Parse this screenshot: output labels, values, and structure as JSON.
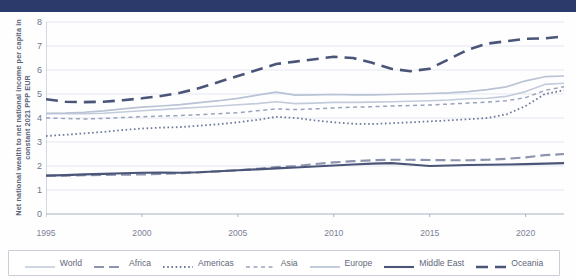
{
  "ylabel_text": "Net national wealth to net national income per capita in constant 2021 PPP EUR",
  "legend": {
    "items": [
      {
        "label": "World",
        "color": "#c3ccdc",
        "dash": "none",
        "width": 1.6
      },
      {
        "label": "Africa",
        "color": "#8d95ae",
        "dash": "10,5",
        "width": 2.2
      },
      {
        "label": "Americas",
        "color": "#6f7a99",
        "dash": "1.6,2.6",
        "width": 1.8
      },
      {
        "label": "Asia",
        "color": "#9aa3bb",
        "dash": "4,3.5",
        "width": 1.5
      },
      {
        "label": "Europe",
        "color": "#b9c3d5",
        "dash": "none",
        "width": 1.7
      },
      {
        "label": "Middle East",
        "color": "#4a5578",
        "dash": "none",
        "width": 2.1
      },
      {
        "label": "Oceania",
        "color": "#4a5578",
        "dash": "12,7",
        "width": 2.6
      }
    ]
  },
  "chart_data": {
    "type": "line",
    "title": "",
    "xlabel": "",
    "ylabel": "Net national wealth to net national income per capita in constant 2021 PPP EUR",
    "xlim": [
      1995,
      2022
    ],
    "ylim": [
      0,
      8
    ],
    "yticks": [
      0,
      1,
      2,
      3,
      4,
      5,
      6,
      7,
      8
    ],
    "xticks": [
      1995,
      2000,
      2005,
      2010,
      2015,
      2020
    ],
    "grid": "horizontal",
    "legend_position": "bottom",
    "x": [
      1995,
      1996,
      1997,
      1998,
      1999,
      2000,
      2001,
      2002,
      2003,
      2004,
      2005,
      2006,
      2007,
      2008,
      2009,
      2010,
      2011,
      2012,
      2013,
      2014,
      2015,
      2016,
      2017,
      2018,
      2019,
      2020,
      2021,
      2022
    ],
    "series": [
      {
        "name": "World",
        "color": "#c3ccdc",
        "dash": "none",
        "values": [
          4.2,
          4.18,
          4.18,
          4.2,
          4.25,
          4.3,
          4.35,
          4.4,
          4.45,
          4.5,
          4.55,
          4.6,
          4.68,
          4.6,
          4.62,
          4.65,
          4.65,
          4.66,
          4.68,
          4.7,
          4.72,
          4.75,
          4.8,
          4.82,
          4.9,
          5.1,
          5.4,
          5.45
        ]
      },
      {
        "name": "Africa",
        "color": "#8d95ae",
        "dash": "10,5",
        "values": [
          1.6,
          1.6,
          1.62,
          1.63,
          1.64,
          1.65,
          1.67,
          1.7,
          1.74,
          1.78,
          1.82,
          1.88,
          1.95,
          2.0,
          2.08,
          2.15,
          2.2,
          2.24,
          2.26,
          2.26,
          2.25,
          2.24,
          2.24,
          2.26,
          2.3,
          2.36,
          2.45,
          2.5
        ]
      },
      {
        "name": "Americas",
        "color": "#6f7a99",
        "dash": "1.6,2.6",
        "values": [
          3.25,
          3.3,
          3.36,
          3.42,
          3.5,
          3.56,
          3.6,
          3.62,
          3.68,
          3.74,
          3.82,
          3.92,
          4.05,
          4.0,
          3.9,
          3.82,
          3.76,
          3.75,
          3.78,
          3.82,
          3.86,
          3.9,
          3.95,
          4.0,
          4.15,
          4.5,
          5.0,
          5.15
        ]
      },
      {
        "name": "Asia",
        "color": "#9aa3bb",
        "dash": "4,3.5",
        "values": [
          4.0,
          3.98,
          3.96,
          3.98,
          4.02,
          4.05,
          4.08,
          4.1,
          4.14,
          4.18,
          4.22,
          4.3,
          4.38,
          4.35,
          4.38,
          4.42,
          4.45,
          4.47,
          4.5,
          4.52,
          4.54,
          4.58,
          4.62,
          4.66,
          4.72,
          4.85,
          5.15,
          5.3
        ]
      },
      {
        "name": "Europe",
        "color": "#b9c3d5",
        "dash": "none",
        "values": [
          4.18,
          4.2,
          4.24,
          4.3,
          4.38,
          4.45,
          4.5,
          4.56,
          4.64,
          4.72,
          4.82,
          4.95,
          5.08,
          4.95,
          4.96,
          4.98,
          4.96,
          4.96,
          4.98,
          5.0,
          5.02,
          5.05,
          5.1,
          5.18,
          5.3,
          5.55,
          5.72,
          5.75
        ]
      },
      {
        "name": "Middle East",
        "color": "#4a5578",
        "dash": "none",
        "values": [
          1.6,
          1.62,
          1.65,
          1.67,
          1.7,
          1.72,
          1.73,
          1.72,
          1.74,
          1.78,
          1.82,
          1.86,
          1.9,
          1.94,
          1.98,
          2.02,
          2.06,
          2.1,
          2.12,
          2.06,
          2.0,
          2.02,
          2.04,
          2.05,
          2.06,
          2.08,
          2.1,
          2.12
        ]
      },
      {
        "name": "Oceania",
        "color": "#4a5578",
        "dash": "12,7",
        "values": [
          4.78,
          4.68,
          4.66,
          4.68,
          4.74,
          4.82,
          4.92,
          5.05,
          5.25,
          5.5,
          5.75,
          6.0,
          6.25,
          6.35,
          6.45,
          6.55,
          6.5,
          6.3,
          6.05,
          5.95,
          6.05,
          6.45,
          6.85,
          7.1,
          7.2,
          7.3,
          7.32,
          7.4
        ]
      }
    ]
  }
}
